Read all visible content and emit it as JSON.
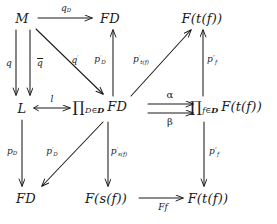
{
  "figure": {
    "kind": "commutative-diagram",
    "background_color": "#ffffff",
    "ink_color": "#1a1a1a",
    "width": 277,
    "height": 224
  },
  "nodes": [
    {
      "id": "M",
      "label": "M",
      "x": 22,
      "y": 18,
      "row": "top",
      "col": "left"
    },
    {
      "id": "FD_top",
      "label": "FD",
      "x": 110,
      "y": 18,
      "row": "top",
      "col": "mid"
    },
    {
      "id": "Ftf_top",
      "label": "F(t(f))",
      "x": 202,
      "y": 18,
      "row": "top",
      "col": "right"
    },
    {
      "id": "L",
      "label": "L",
      "x": 22,
      "y": 108,
      "row": "middle",
      "col": "left"
    },
    {
      "id": "prodFD",
      "label": "∏D∈D FD",
      "x": 100,
      "y": 108,
      "row": "middle",
      "col": "mid"
    },
    {
      "id": "prodFtf",
      "label": "∏f∈D F(t(f))",
      "x": 226,
      "y": 108,
      "row": "middle",
      "col": "right"
    },
    {
      "id": "FD_bot",
      "label": "FD",
      "x": 26,
      "y": 198,
      "row": "bottom",
      "col": "left"
    },
    {
      "id": "Fsf_bot",
      "label": "F(s(f))",
      "x": 106,
      "y": 198,
      "row": "bottom",
      "col": "mid"
    },
    {
      "id": "Ftf_bot",
      "label": "F(t(f))",
      "x": 208,
      "y": 198,
      "row": "bottom",
      "col": "right"
    }
  ],
  "arrow_labels": {
    "q_D": {
      "base": "q",
      "sub": "D",
      "prime": "",
      "overline": false,
      "x": 66,
      "y": 9
    },
    "q": {
      "base": "q",
      "sub": "",
      "prime": "",
      "overline": false,
      "x": 9,
      "y": 63
    },
    "q_bar": {
      "base": "q",
      "sub": "",
      "prime": "",
      "overline": true,
      "x": 28,
      "y": 63
    },
    "q_prime": {
      "base": "q",
      "sub": "",
      "prime": "′",
      "overline": false,
      "x": 75,
      "y": 60
    },
    "p_prime_D_up": {
      "base": "p",
      "sub": "D",
      "prime": "′",
      "overline": false,
      "x": 100,
      "y": 60
    },
    "p_prime_tf": {
      "base": "p",
      "sub": "t(f)",
      "prime": "′",
      "overline": false,
      "x": 139,
      "y": 60
    },
    "p_dprime_f_up": {
      "base": "p",
      "sub": "f",
      "prime": "″",
      "overline": false,
      "x": 212,
      "y": 60
    },
    "l": {
      "base": "l",
      "sub": "",
      "prime": "",
      "overline": false,
      "x": 52,
      "y": 99
    },
    "alpha": {
      "base": "α",
      "sub": "",
      "prime": "",
      "overline": false,
      "x": 172,
      "y": 97
    },
    "beta": {
      "base": "β",
      "sub": "",
      "prime": "",
      "overline": false,
      "x": 172,
      "y": 120
    },
    "p_D": {
      "base": "p",
      "sub": "D",
      "prime": "",
      "overline": false,
      "x": 12,
      "y": 152
    },
    "p_prime_D_down": {
      "base": "p",
      "sub": "D",
      "prime": "′",
      "overline": false,
      "x": 50,
      "y": 152
    },
    "p_prime_sf": {
      "base": "p",
      "sub": "s(f)",
      "prime": "′",
      "overline": false,
      "x": 117,
      "y": 152
    },
    "p_dprime_f_down": {
      "base": "p",
      "sub": "f",
      "prime": "″",
      "overline": false,
      "x": 213,
      "y": 152
    },
    "Ff": {
      "base": "Ff",
      "sub": "",
      "prime": "",
      "overline": false,
      "x": 165,
      "y": 207
    }
  },
  "arrows": [
    {
      "id": "arrow-qD",
      "from": "M",
      "to": "FD_top",
      "style": "plain",
      "direction": "right",
      "label_key": "q_D"
    },
    {
      "id": "arrow-q",
      "from": "M",
      "to": "L",
      "style": "plain",
      "direction": "down",
      "label_key": "q"
    },
    {
      "id": "arrow-qbar",
      "from": "M",
      "to": "L",
      "style": "plain",
      "direction": "down",
      "label_key": "q_bar"
    },
    {
      "id": "arrow-qprime",
      "from": "M",
      "to": "prodFD",
      "style": "plain",
      "direction": "down-right",
      "label_key": "q_prime"
    },
    {
      "id": "arrow-pprimeD-up",
      "from": "prodFD",
      "to": "FD_top",
      "style": "plain",
      "direction": "up",
      "label_key": "p_prime_D_up"
    },
    {
      "id": "arrow-pprimetf",
      "from": "prodFD",
      "to": "Ftf_top",
      "style": "plain",
      "direction": "up-right",
      "label_key": "p_prime_tf"
    },
    {
      "id": "arrow-pdprimef-up",
      "from": "prodFtf",
      "to": "Ftf_top",
      "style": "plain",
      "direction": "up",
      "label_key": "p_dprime_f_up"
    },
    {
      "id": "arrow-l",
      "from": "L",
      "to": "prodFD",
      "style": "mono",
      "direction": "right",
      "label_key": "l"
    },
    {
      "id": "arrow-alpha",
      "from": "prodFD",
      "to": "prodFtf",
      "style": "plain",
      "direction": "right",
      "label_key": "alpha"
    },
    {
      "id": "arrow-beta",
      "from": "prodFD",
      "to": "prodFtf",
      "style": "plain",
      "direction": "right",
      "label_key": "beta"
    },
    {
      "id": "arrow-pD",
      "from": "L",
      "to": "FD_bot",
      "style": "plain",
      "direction": "down",
      "label_key": "p_D"
    },
    {
      "id": "arrow-pprimeD-down",
      "from": "prodFD",
      "to": "FD_bot",
      "style": "plain",
      "direction": "down-left",
      "label_key": "p_prime_D_down"
    },
    {
      "id": "arrow-pprimesf",
      "from": "prodFD",
      "to": "Fsf_bot",
      "style": "plain",
      "direction": "down",
      "label_key": "p_prime_sf"
    },
    {
      "id": "arrow-pdprimef-down",
      "from": "prodFtf",
      "to": "Ftf_bot",
      "style": "plain",
      "direction": "down",
      "label_key": "p_dprime_f_down"
    },
    {
      "id": "arrow-Ff",
      "from": "Fsf_bot",
      "to": "Ftf_bot",
      "style": "plain",
      "direction": "right",
      "label_key": "Ff"
    }
  ],
  "node_text": {
    "M": "M",
    "FD_top": "FD",
    "Ftf_top_F": "F",
    "Ftf_top_arg": "(t(f))",
    "L": "L",
    "prodFD_sub": "D∈",
    "prodFD_cat": "D",
    "prodFD_body": "FD",
    "prodFtf_sub": "f∈",
    "prodFtf_cat": "D",
    "prodFtf_body": "F(t(f))",
    "FD_bot": "FD",
    "Fsf_bot": "F(s(f))",
    "Ftf_bot": "F(t(f))"
  }
}
